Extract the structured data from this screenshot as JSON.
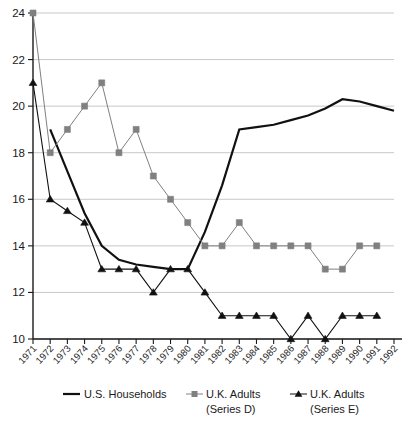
{
  "chart_data": {
    "type": "line",
    "title": "",
    "subtitle": "",
    "xlabel": "",
    "ylabel": "",
    "xlim": [
      1971,
      1992
    ],
    "ylim": [
      10,
      24
    ],
    "grid": true,
    "legend_position": "bottom",
    "x": [
      1971,
      1972,
      1973,
      1974,
      1975,
      1976,
      1977,
      1978,
      1979,
      1980,
      1981,
      1982,
      1983,
      1984,
      1985,
      1986,
      1987,
      1988,
      1989,
      1990,
      1991,
      1992
    ],
    "categories": [
      "1971",
      "1972",
      "1973",
      "1974",
      "1975",
      "1976",
      "1977",
      "1978",
      "1979",
      "1980",
      "1981",
      "1982",
      "1983",
      "1984",
      "1985",
      "1986",
      "1987",
      "1988",
      "1989",
      "1990",
      "1991",
      "1992"
    ],
    "ytick_labels": [
      "10",
      "12",
      "14",
      "16",
      "18",
      "20",
      "22",
      "24"
    ],
    "ytick_values": [
      10,
      12,
      14,
      16,
      18,
      20,
      22,
      24
    ],
    "series": [
      {
        "name": "U.S. Households",
        "marker": "none",
        "color": "#111111",
        "x": [
          1972,
          1973,
          1974,
          1975,
          1976,
          1977,
          1978,
          1979,
          1980,
          1981,
          1982,
          1983,
          1984,
          1985,
          1986,
          1987,
          1988,
          1989,
          1990,
          1991,
          1992
        ],
        "values": [
          19.0,
          17.2,
          15.4,
          14.0,
          13.4,
          13.2,
          13.1,
          13.0,
          13.0,
          14.6,
          16.6,
          19.0,
          19.1,
          19.2,
          19.4,
          19.6,
          19.9,
          20.3,
          20.2,
          20.0,
          19.8
        ]
      },
      {
        "name": "U.K. Adults (Series D)",
        "marker": "square",
        "color": "#808080",
        "x": [
          1971,
          1972,
          1973,
          1974,
          1975,
          1976,
          1977,
          1978,
          1979,
          1980,
          1981,
          1982,
          1983,
          1984,
          1985,
          1986,
          1987,
          1988,
          1989,
          1990,
          1991
        ],
        "values": [
          24,
          18,
          19,
          20,
          21,
          18,
          19,
          17,
          16,
          15,
          14,
          14,
          15,
          14,
          14,
          14,
          14,
          13,
          13,
          14,
          14
        ]
      },
      {
        "name": "U.K. Adults (Series E)",
        "marker": "triangle",
        "color": "#111111",
        "x": [
          1971,
          1972,
          1973,
          1974,
          1975,
          1976,
          1977,
          1978,
          1979,
          1980,
          1981,
          1982,
          1983,
          1984,
          1985,
          1986,
          1987,
          1988,
          1989,
          1990,
          1991
        ],
        "values": [
          21,
          16,
          15.5,
          15,
          13,
          13,
          13,
          12,
          13,
          13,
          12,
          11,
          11,
          11,
          11,
          10,
          11,
          10,
          11,
          11,
          11
        ]
      }
    ]
  },
  "legend": {
    "items": [
      {
        "label": "U.S. Households",
        "label_line2": ""
      },
      {
        "label": "U.K. Adults",
        "label_line2": "(Series D)"
      },
      {
        "label": "U.K. Adults",
        "label_line2": "(Series E)"
      }
    ]
  }
}
